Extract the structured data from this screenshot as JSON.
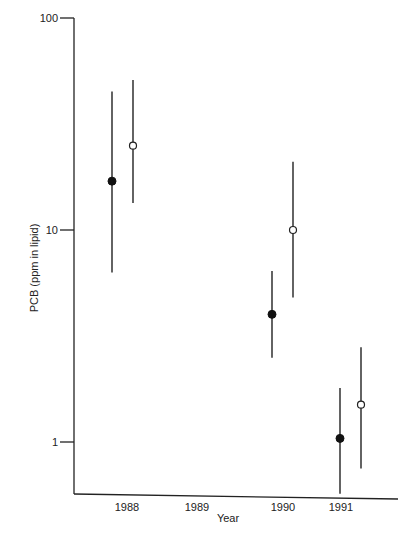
{
  "chart_data": {
    "type": "scatter",
    "subtype": "errorbar",
    "title": "",
    "xlabel": "Year",
    "ylabel": "PCB (ppm in lipid)",
    "yscale": "log",
    "ylim": [
      0.57,
      100
    ],
    "y_ticks": [
      {
        "label": "100",
        "value": 100
      },
      {
        "label": "10",
        "value": 10
      },
      {
        "label": "1",
        "value": 1
      }
    ],
    "x_ticks": [
      "1988",
      "1989",
      "1990",
      "1991"
    ],
    "grid": false,
    "legend": null,
    "series": [
      {
        "name": "filled",
        "marker": "filled-circle",
        "points": [
          {
            "x": "1988",
            "y": 17,
            "low": 6.3,
            "high": 45
          },
          {
            "x": "1990",
            "y": 4,
            "low": 2.5,
            "high": 6.4
          },
          {
            "x": "1991",
            "y": 1.04,
            "low": 0.57,
            "high": 1.8
          }
        ]
      },
      {
        "name": "open",
        "marker": "open-circle",
        "points": [
          {
            "x": "1988",
            "y": 25,
            "low": 13.4,
            "high": 51
          },
          {
            "x": "1990",
            "y": 10,
            "low": 4.8,
            "high": 21
          },
          {
            "x": "1991",
            "y": 1.5,
            "low": 0.75,
            "high": 2.8
          }
        ]
      }
    ]
  },
  "layout": {
    "x_positions": {
      "filled": {
        "1988": 112,
        "1990": 272,
        "1991": 340
      },
      "open": {
        "1988": 133,
        "1990": 293,
        "1991": 361
      }
    },
    "x_tick_label_positions": {
      "1988": 127,
      "1989": 197,
      "1990": 283,
      "1991": 341
    }
  }
}
